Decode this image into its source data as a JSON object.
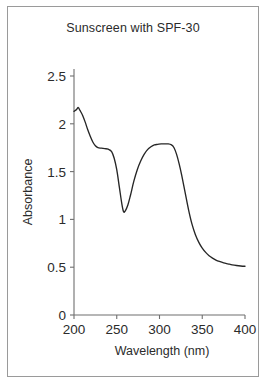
{
  "figure": {
    "title": "Sunscreen with SPF-30",
    "border_color": "#9a9a9a",
    "background": "#ffffff"
  },
  "chart_data": {
    "type": "line",
    "title": "Sunscreen with SPF-30",
    "xlabel": "Wavelength (nm)",
    "ylabel": "Absorbance",
    "xlim": [
      200,
      400
    ],
    "ylim": [
      0,
      2.5
    ],
    "xticks": [
      200,
      250,
      300,
      350,
      400
    ],
    "xtick_labels": [
      "200",
      "250",
      "300",
      "350",
      "400"
    ],
    "yticks": [
      0,
      0.5,
      1,
      1.5,
      2,
      2.5
    ],
    "ytick_labels": [
      "0",
      "0.5",
      "1",
      "1.5",
      "2",
      "2.5"
    ],
    "grid": false,
    "legend": null,
    "line_color": "#262626",
    "axis_color": "#6f6f6f",
    "series": [
      {
        "name": "Absorbance spectrum",
        "x": [
          200,
          203,
          205,
          207,
          210,
          213,
          216,
          219,
          222,
          225,
          228,
          232,
          236,
          240,
          244,
          247,
          250,
          253,
          256,
          258,
          260,
          263,
          266,
          270,
          274,
          278,
          282,
          286,
          290,
          294,
          298,
          302,
          306,
          310,
          314,
          317,
          320,
          323,
          326,
          330,
          334,
          338,
          342,
          346,
          350,
          354,
          358,
          362,
          366,
          370,
          375,
          380,
          385,
          390,
          395,
          400
        ],
        "y": [
          2.13,
          2.15,
          2.17,
          2.14,
          2.09,
          2.02,
          1.94,
          1.87,
          1.81,
          1.77,
          1.75,
          1.745,
          1.74,
          1.735,
          1.71,
          1.64,
          1.52,
          1.34,
          1.16,
          1.08,
          1.09,
          1.15,
          1.25,
          1.4,
          1.52,
          1.61,
          1.68,
          1.73,
          1.76,
          1.78,
          1.785,
          1.79,
          1.79,
          1.79,
          1.78,
          1.75,
          1.68,
          1.58,
          1.46,
          1.28,
          1.1,
          0.95,
          0.84,
          0.76,
          0.7,
          0.655,
          0.62,
          0.595,
          0.575,
          0.56,
          0.545,
          0.535,
          0.525,
          0.518,
          0.513,
          0.51
        ]
      }
    ],
    "annotations": [
      {
        "label": "shoulder",
        "x": 236,
        "y": 1.74
      },
      {
        "label": "trough-minimum",
        "x": 258,
        "y": 1.08
      },
      {
        "label": "peak-plateau",
        "x": 304,
        "y": 1.79
      },
      {
        "label": "tail-plateau",
        "x": 400,
        "y": 0.51
      }
    ]
  }
}
